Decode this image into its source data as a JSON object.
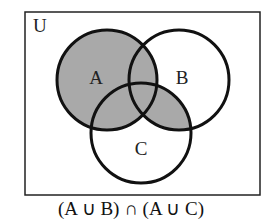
{
  "diagram": {
    "type": "venn",
    "universe_label": "U",
    "sets": [
      {
        "label": "A",
        "cx": 107,
        "cy": 80,
        "r": 50,
        "label_x": 96,
        "label_y": 80
      },
      {
        "label": "B",
        "cx": 179,
        "cy": 80,
        "r": 50,
        "label_x": 182,
        "label_y": 80
      },
      {
        "label": "C",
        "cx": 141,
        "cy": 133,
        "r": 50,
        "label_x": 141,
        "label_y": 151
      }
    ],
    "shaded_regions": [
      "A",
      "B ∩ C"
    ],
    "colors": {
      "shade": "#a9a9a9",
      "stroke": "#111111",
      "background": "#ffffff"
    },
    "caption": "(A ∪ B) ∩ (A ∪ C)"
  }
}
